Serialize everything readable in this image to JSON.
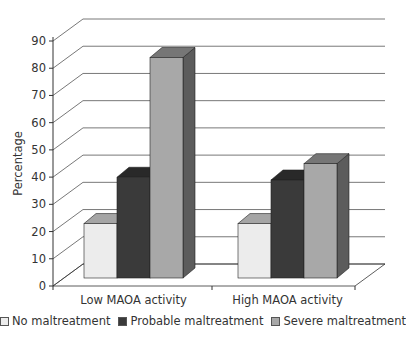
{
  "chart_data": {
    "type": "bar",
    "style": "3d-clustered",
    "title": "",
    "xlabel": "",
    "ylabel": "Percentage",
    "ylim": [
      0,
      90
    ],
    "yticks": [
      0,
      10,
      20,
      30,
      40,
      50,
      60,
      70,
      80,
      90
    ],
    "grid": true,
    "legend_position": "bottom",
    "categories": [
      "Low MAOA activity",
      "High MAOA activity"
    ],
    "series": [
      {
        "name": "No maltreatment",
        "values": [
          20,
          20
        ],
        "color": "#ececec"
      },
      {
        "name": "Probable maltreatment",
        "values": [
          37,
          36
        ],
        "color": "#3a3a3a"
      },
      {
        "name": "Severe maltreatment",
        "values": [
          81,
          42
        ],
        "color": "#a8a8a8"
      }
    ]
  },
  "legend": {
    "items": [
      {
        "label": "No maltreatment",
        "color": "#ececec"
      },
      {
        "label": "Probable maltreatment",
        "color": "#3a3a3a"
      },
      {
        "label": "Severe maltreatment",
        "color": "#a8a8a8"
      }
    ]
  }
}
